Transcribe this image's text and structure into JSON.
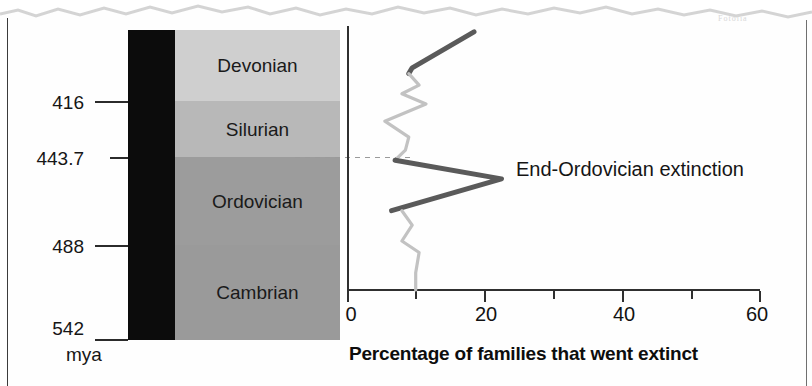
{
  "figure": {
    "watermark": "Fotolia",
    "mya_label": "mya"
  },
  "timescale": {
    "title": "Geologic time scale",
    "unit": "mya",
    "bands": [
      {
        "name": "Devonian",
        "top_mya": 416,
        "color": "#cfcfcf"
      },
      {
        "name": "Silurian",
        "top_mya": 443.7,
        "color": "#b8b8b8"
      },
      {
        "name": "Ordovician",
        "top_mya": 488,
        "color": "#9c9c9c"
      },
      {
        "name": "Cambrian",
        "top_mya": 542,
        "color": "#9a9a9a"
      }
    ],
    "tick_labels": [
      "416",
      "443.7",
      "488",
      "542"
    ]
  },
  "chart_data": {
    "type": "line",
    "title": "",
    "xlabel": "Percentage of families that went extinct",
    "ylabel": "",
    "xlim": [
      0,
      60
    ],
    "ylim": [
      542,
      359
    ],
    "grid": false,
    "legend": null,
    "xticks": [
      0,
      20,
      40,
      60
    ],
    "xtick_labels": [
      "0",
      "20",
      "40",
      "60"
    ],
    "xminor_ticks": [
      10,
      30,
      50
    ],
    "orientation": "horizontal-value-vertical-time",
    "annotations": [
      {
        "text": "End-Ordovician extinction",
        "x": 22.5,
        "y": 443.7
      }
    ],
    "series": [
      {
        "name": "Extinction intensity (highlighted)",
        "color": "#5a5a5a",
        "points": [
          {
            "x": 18.5,
            "y": 363
          },
          {
            "x": 9.5,
            "y": 388
          },
          {
            "x": 9.0,
            "y": 392
          }
        ]
      },
      {
        "name": "Extinction intensity (background)",
        "color": "#c2c2c2",
        "points": [
          {
            "x": 9.0,
            "y": 392
          },
          {
            "x": 10.5,
            "y": 400
          },
          {
            "x": 8.0,
            "y": 406
          },
          {
            "x": 11.5,
            "y": 413
          },
          {
            "x": 5.5,
            "y": 425
          },
          {
            "x": 9.0,
            "y": 436
          },
          {
            "x": 8.5,
            "y": 445
          },
          {
            "x": 7.0,
            "y": 452
          }
        ]
      },
      {
        "name": "End-Ordovician peak",
        "color": "#5a5a5a",
        "points": [
          {
            "x": 7.0,
            "y": 452
          },
          {
            "x": 22.5,
            "y": 465
          },
          {
            "x": 6.5,
            "y": 487
          }
        ]
      },
      {
        "name": "Cambrian background",
        "color": "#c2c2c2",
        "points": [
          {
            "x": 8.0,
            "y": 487
          },
          {
            "x": 9.5,
            "y": 497
          },
          {
            "x": 8.0,
            "y": 508
          },
          {
            "x": 10.5,
            "y": 516
          },
          {
            "x": 10.0,
            "y": 530
          },
          {
            "x": 10.0,
            "y": 542
          }
        ]
      }
    ]
  }
}
